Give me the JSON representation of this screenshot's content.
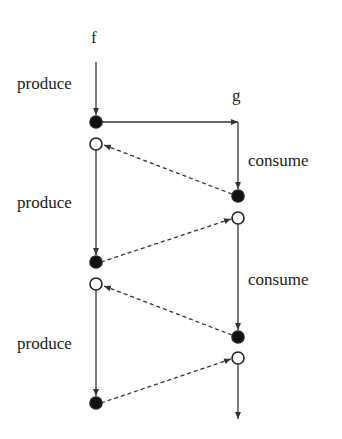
{
  "diagram": {
    "processes": [
      {
        "name": "f",
        "x": 96
      },
      {
        "name": "g",
        "x": 238
      }
    ],
    "labels": {
      "f": "f",
      "g": "g",
      "produce_1": "produce",
      "produce_2": "produce",
      "produce_3": "produce",
      "consume_1": "consume",
      "consume_2": "consume"
    },
    "nodes": {
      "f_filled": [
        122,
        262,
        403
      ],
      "f_hollow": [
        144,
        284
      ],
      "g_filled": [
        196,
        337
      ],
      "g_hollow": [
        218,
        358
      ]
    },
    "colors": {
      "line": "#333333",
      "fill": "#111111",
      "background": "#ffffff"
    }
  }
}
